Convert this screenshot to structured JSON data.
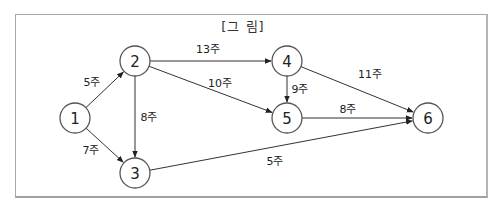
{
  "figure": {
    "title": "[그 림]",
    "nodes": [
      {
        "id": "1",
        "label": "1"
      },
      {
        "id": "2",
        "label": "2"
      },
      {
        "id": "3",
        "label": "3"
      },
      {
        "id": "4",
        "label": "4"
      },
      {
        "id": "5",
        "label": "5"
      },
      {
        "id": "6",
        "label": "6"
      }
    ],
    "edges": [
      {
        "from": "1",
        "to": "2",
        "label": "5주"
      },
      {
        "from": "1",
        "to": "3",
        "label": "7주"
      },
      {
        "from": "2",
        "to": "3",
        "label": "8주"
      },
      {
        "from": "2",
        "to": "4",
        "label": "13주"
      },
      {
        "from": "2",
        "to": "5",
        "label": "10주"
      },
      {
        "from": "4",
        "to": "5",
        "label": "9주"
      },
      {
        "from": "4",
        "to": "6",
        "label": "11주"
      },
      {
        "from": "5",
        "to": "6",
        "label": "8주"
      },
      {
        "from": "3",
        "to": "6",
        "label": "5주"
      }
    ]
  }
}
